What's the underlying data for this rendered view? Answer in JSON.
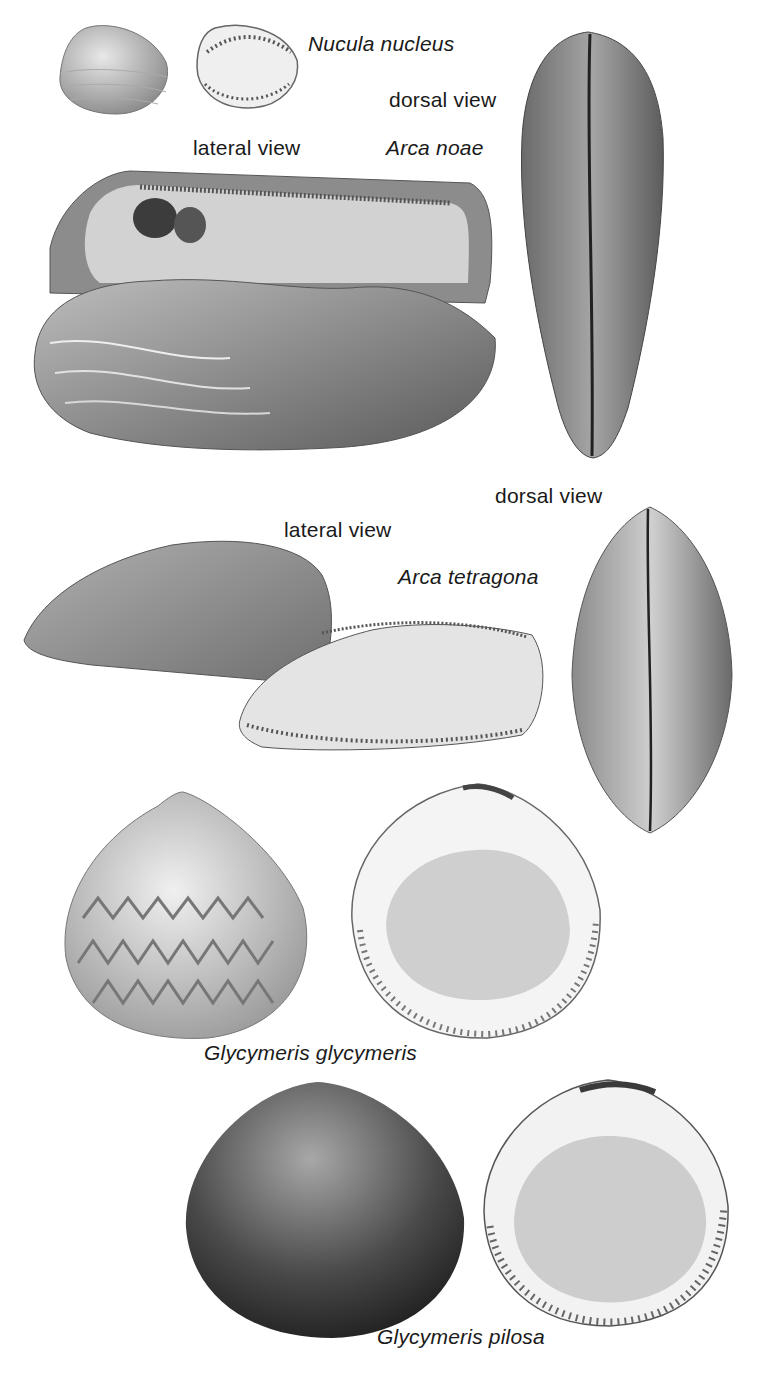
{
  "plate": {
    "labels": {
      "nucula_name": "Nucula nucleus",
      "arca_noae_dorsal": "dorsal view",
      "arca_noae_lateral": "lateral view",
      "arca_noae_name": "Arca noae",
      "arca_tetragona_dorsal": "dorsal view",
      "arca_tetragona_lateral": "lateral view",
      "arca_tetragona_name": "Arca tetragona",
      "glycymeris_glycymeris_name": "Glycymeris glycymeris",
      "glycymeris_pilosa_name": "Glycymeris pilosa"
    },
    "species": [
      {
        "name": "Nucula nucleus",
        "views": [
          "exterior",
          "interior"
        ]
      },
      {
        "name": "Arca noae",
        "views": [
          "lateral view",
          "dorsal view"
        ]
      },
      {
        "name": "Arca tetragona",
        "views": [
          "lateral view",
          "dorsal view"
        ]
      },
      {
        "name": "Glycymeris glycymeris",
        "views": [
          "exterior",
          "interior"
        ]
      },
      {
        "name": "Glycymeris pilosa",
        "views": [
          "exterior",
          "interior"
        ]
      }
    ],
    "colors": {
      "background": "#ffffff",
      "text": "#1a1a1a",
      "shell_light": "#d9d9d9",
      "shell_mid": "#9a9a9a",
      "shell_dark": "#3a3a3a"
    }
  }
}
